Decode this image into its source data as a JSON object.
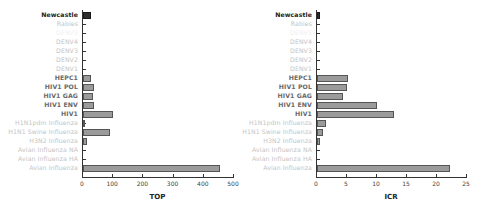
{
  "chart_data": [
    {
      "type": "bar",
      "orientation": "horizontal",
      "title": "",
      "xlabel": "TOP",
      "ylabel": "",
      "xlim": [
        0,
        500
      ],
      "xticks": [
        "0",
        "100",
        "200",
        "300",
        "400",
        "500"
      ],
      "categories": [
        "Newcastle",
        "Rabies",
        "",
        "DENV4",
        "DENV3",
        "DENV2",
        "DENV1",
        "HEPC1",
        "HIV1 POL",
        "HIV1 GAG",
        "HIV1 ENV",
        "HIV1",
        "H1N1pdm Influenza",
        "H1N1 Swine Influenza",
        "H3N2 Influenza",
        "Avian Influenza NA",
        "Avian Influenza HA",
        "Avian Influenza"
      ],
      "values": [
        25,
        0,
        0,
        0,
        0,
        0,
        0,
        25,
        35,
        32,
        38,
        100,
        6,
        90,
        14,
        0,
        0,
        455
      ],
      "grid": false,
      "legend": null
    },
    {
      "type": "bar",
      "orientation": "horizontal",
      "title": "",
      "xlabel": "ICR",
      "ylabel": "",
      "xlim": [
        0,
        25
      ],
      "xticks": [
        "0",
        "5",
        "10",
        "15",
        "20",
        "25"
      ],
      "categories": [
        "Newcastle",
        "Rabies",
        "",
        "DENV4",
        "DENV3",
        "DENV2",
        "DENV1",
        "HEPC1",
        "HIV1 POL",
        "HIV1 GAG",
        "HIV1 ENV",
        "HIV1",
        "H1N1pdm Influenza",
        "H1N1 Swine Influenza",
        "H3N2 Influenza",
        "Avian Influenza NA",
        "Avian Influenza HA",
        "Avian Influenza"
      ],
      "values": [
        0.5,
        0,
        0,
        0,
        0,
        0,
        0,
        5.2,
        5.0,
        4.3,
        10.0,
        12.8,
        1.5,
        1.0,
        0.5,
        0,
        0,
        22.2
      ],
      "grid": false,
      "legend": null
    }
  ],
  "label_styles": [
    "bold",
    "faint",
    "ghost",
    "faint",
    "faint",
    "faint",
    "faint",
    "mid",
    "mid",
    "mid",
    "mid",
    "mid",
    "faint",
    "faint",
    "faint",
    "faint",
    "faint",
    "faint"
  ],
  "colors": {
    "bar": "#9b9b9b",
    "highlight_bar": "#2e2e2e",
    "axis": "#333333"
  }
}
